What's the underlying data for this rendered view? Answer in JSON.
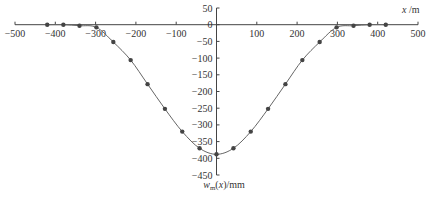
{
  "chart_data": {
    "type": "line",
    "title": "",
    "xlabel": "x/m",
    "ylabel": "w_m(x)/mm",
    "xlim": [
      -500,
      500
    ],
    "ylim": [
      -450,
      50
    ],
    "x_ticks": [
      -500,
      -400,
      -300,
      -200,
      -100,
      0,
      100,
      200,
      300,
      400,
      500
    ],
    "y_ticks": [
      50,
      0,
      -50,
      -100,
      -150,
      -200,
      -250,
      -300,
      -350,
      -400,
      -450
    ],
    "grid": false,
    "legend": "none",
    "series": [
      {
        "name": "settlement curve",
        "style": "line-with-markers",
        "color": "#555555",
        "x": [
          -420,
          -380,
          -340,
          -298,
          -256,
          -213,
          -171,
          -128,
          -85,
          -42,
          0,
          42,
          85,
          128,
          171,
          213,
          256,
          298,
          340,
          380,
          420
        ],
        "y": [
          0,
          0,
          -3,
          -8,
          -52,
          -106,
          -178,
          -252,
          -320,
          -370,
          -388,
          -370,
          -320,
          -252,
          -178,
          -106,
          -52,
          -8,
          -3,
          0,
          0
        ]
      }
    ]
  }
}
